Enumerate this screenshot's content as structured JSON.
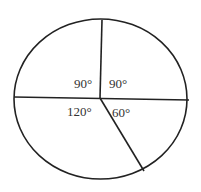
{
  "diagram": {
    "type": "circle-sectors",
    "stroke_color": "#222222",
    "sectors": [
      {
        "label": "90°",
        "angle": 90,
        "position": "upper-left"
      },
      {
        "label": "90°",
        "angle": 90,
        "position": "upper-right"
      },
      {
        "label": "120°",
        "angle": 120,
        "position": "lower-left"
      },
      {
        "label": "60°",
        "angle": 60,
        "position": "lower-right"
      }
    ]
  }
}
